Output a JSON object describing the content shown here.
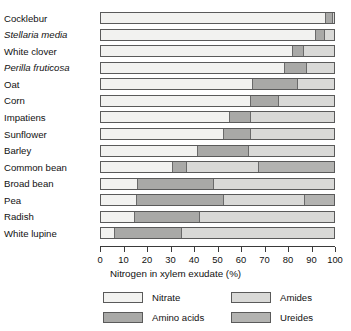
{
  "chart_data": {
    "type": "bar",
    "orientation": "horizontal",
    "stacked": true,
    "title": "",
    "xlabel": "Nitrogen in xylem exudate (%)",
    "ylabel": "",
    "xlim": [
      0,
      100
    ],
    "xticks": [
      0,
      10,
      20,
      30,
      40,
      50,
      60,
      70,
      80,
      90,
      100
    ],
    "xtick_labels": [
      "0",
      "10",
      "20",
      "30",
      "40",
      "50",
      "60",
      "70",
      "80",
      "90",
      "100"
    ],
    "grid": false,
    "legend_position": "bottom",
    "categories": [
      "Cocklebur",
      "Stellaria media",
      "White clover",
      "Perilla fruticosa",
      "Oat",
      "Corn",
      "Impatiens",
      "Sunflower",
      "Barley",
      "Common bean",
      "Broad bean",
      "Pea",
      "Radish",
      "White lupine"
    ],
    "categories_italic": [
      false,
      true,
      false,
      true,
      false,
      false,
      false,
      false,
      false,
      false,
      false,
      false,
      false,
      false
    ],
    "series": [
      {
        "name": "Nitrate",
        "color": "#f2f2f0",
        "values": [
          96.0,
          92.0,
          82.0,
          78.5,
          65.0,
          64.0,
          55.0,
          52.5,
          41.0,
          30.5,
          15.5,
          15.0,
          14.0,
          5.5
        ]
      },
      {
        "name": "Amino acids",
        "color": "#a9a9a7",
        "values": [
          3.0,
          3.5,
          4.5,
          9.5,
          19.0,
          12.0,
          9.0,
          11.5,
          22.0,
          6.0,
          32.5,
          37.5,
          28.0,
          29.0
        ]
      },
      {
        "name": "Amides",
        "color": "#d9d9d7",
        "values": [
          1.0,
          4.5,
          13.5,
          12.0,
          16.0,
          24.0,
          36.0,
          36.0,
          37.0,
          31.0,
          52.0,
          34.5,
          58.0,
          65.5
        ]
      },
      {
        "name": "Ureides",
        "color": "#b3b3b1",
        "values": [
          0.0,
          0.0,
          0.0,
          0.0,
          0.0,
          0.0,
          0.0,
          0.0,
          0.0,
          32.5,
          0.0,
          13.0,
          0.0,
          0.0
        ]
      }
    ],
    "legend_entries": [
      {
        "label": "Nitrate",
        "color": "#f2f2f0"
      },
      {
        "label": "Amides",
        "color": "#d9d9d7"
      },
      {
        "label": "Amino acids",
        "color": "#a9a9a7"
      },
      {
        "label": "Ureides",
        "color": "#b3b3b1"
      }
    ]
  }
}
